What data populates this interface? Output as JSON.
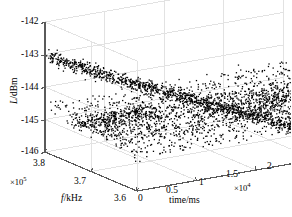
{
  "figure": {
    "type": "3d-scatter",
    "background_color": "#ffffff",
    "grid_color": "#e2e2e2",
    "axis_color": "#5a5a5a",
    "marker_color": "#000000"
  },
  "axes": {
    "vertical": {
      "name": "L/dBm",
      "name_italic_part": "L",
      "name_rest": "/dBm",
      "ticks": [
        "-142",
        "-143",
        "-144",
        "-145",
        "-146"
      ],
      "min": -146,
      "max": -142
    },
    "depth": {
      "name": "f/kHz",
      "name_italic_part": "f",
      "name_rest": "/kHz",
      "ticks": [
        "3.8",
        "3.7",
        "3.6"
      ],
      "multiplier": "×10",
      "multiplier_exp": "5",
      "min": 3.6,
      "max": 3.8
    },
    "horizontal": {
      "name": "time/ms",
      "ticks": [
        "0",
        "0.5",
        "1",
        "1.5",
        "2"
      ],
      "multiplier": "×10",
      "multiplier_exp": "4",
      "min": 0,
      "max": 2
    }
  },
  "caption": "",
  "chart_data": {
    "type": "scatter",
    "title": "",
    "xlabel": "time/ms",
    "ylabel": "f/kHz",
    "zlabel": "L/dBm",
    "xlim": [
      0,
      2
    ],
    "ylim": [
      3.6,
      3.8
    ],
    "zlim": [
      -146,
      -142
    ],
    "x_multiplier": 10000,
    "y_multiplier": 100000,
    "grid": true,
    "legend": null,
    "series": [
      {
        "name": "descending-ridge",
        "description": "Diagonal band descending from about -143 dBm at low time / high frequency to about -146 dBm at high time / low frequency",
        "z_start": -143.0,
        "z_end": -146.0,
        "noise_dbm": 0.18,
        "point_count": 900
      },
      {
        "name": "flat-band",
        "description": "Near-horizontal noise floor band centred close to -144.8 dBm spanning the full time range",
        "z_start": -144.6,
        "z_end": -145.0,
        "noise_dbm": 0.22,
        "point_count": 900
      }
    ]
  }
}
